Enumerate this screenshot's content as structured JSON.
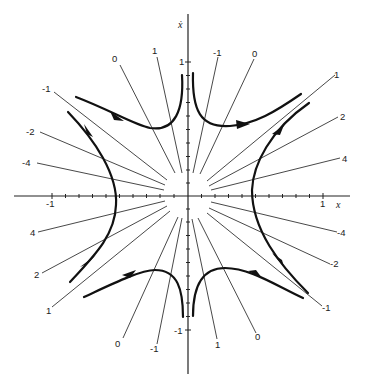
{
  "figure": {
    "axes": {
      "x_label": "x",
      "y_label": "ẋ",
      "x_ticks": [
        {
          "label": "-1",
          "value": -1
        },
        {
          "label": "1",
          "value": 1
        }
      ],
      "y_ticks": [
        {
          "label": "1",
          "value": 1
        },
        {
          "label": "-1",
          "value": -1
        }
      ]
    },
    "isocline_labels": {
      "top_left": [
        "0",
        "1",
        "-1",
        "-2",
        "-4"
      ],
      "top_right": [
        "-1",
        "0",
        "1",
        "2",
        "4"
      ],
      "bottom_left": [
        "4",
        "2",
        "1",
        "0",
        "-1"
      ],
      "bottom_right": [
        "-4",
        "-2",
        "-1",
        "0",
        "1"
      ]
    },
    "labels": {
      "tl_0": "0",
      "tl_1": "1",
      "tl_m1": "-1",
      "tl_m2": "-2",
      "tl_m4": "-4",
      "tr_m1": "-1",
      "tr_0": "0",
      "tr_1": "1",
      "tr_2": "2",
      "tr_4": "4",
      "bl_4": "4",
      "bl_2": "2",
      "bl_1": "1",
      "bl_0": "0",
      "bl_m1": "-1",
      "br_m4": "-4",
      "br_m2": "-2",
      "br_m1": "-1",
      "br_0": "0",
      "br_1": "1",
      "x_tick_neg": "-1",
      "x_tick_pos": "1",
      "y_tick_pos": "1",
      "y_tick_neg": "-1",
      "x_axis": "x",
      "y_axis": "ẋ"
    },
    "colors": {
      "ink": "#222222",
      "background": "#ffffff"
    }
  }
}
